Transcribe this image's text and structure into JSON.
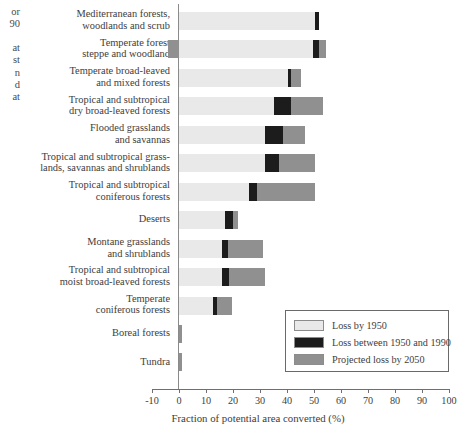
{
  "clipped_text": {
    "note": "text clipped at the left edge of the screenshot",
    "lines_top": [
      "or",
      "90"
    ],
    "lines_bottom": [
      "at",
      "st",
      "n",
      "d",
      "at"
    ]
  },
  "colors": {
    "loss_1950": "#e9e9e9",
    "loss_1950_1990": "#1c1c1c",
    "projected_2050": "#909090",
    "axis": "#6f6f6f",
    "text": "#3d3d3d"
  },
  "legend": {
    "items": [
      {
        "label": "Loss by 1950",
        "color_key": "loss_1950"
      },
      {
        "label": "Loss between 1950 and 1990",
        "color_key": "loss_1950_1990"
      },
      {
        "label": "Projected loss by 2050",
        "color_key": "projected_2050"
      }
    ]
  },
  "chart_data": {
    "type": "bar",
    "orientation": "horizontal",
    "stacked": true,
    "title": "",
    "xlabel": "Fraction of potential area converted (%)",
    "ylabel": "",
    "xlim": [
      -10,
      100
    ],
    "xticks": [
      -10,
      0,
      10,
      20,
      30,
      40,
      50,
      60,
      70,
      80,
      90,
      100
    ],
    "xtick_labels": [
      "-10",
      "0",
      "10",
      "20",
      "30",
      "40",
      "50",
      "60",
      "70",
      "80",
      "90",
      "100"
    ],
    "grid": false,
    "legend_position": "lower right",
    "categories": [
      "Mediterranean forests, woodlands and scrub",
      "Temperate forest steppe and woodland",
      "Temperate broad-leaved and mixed forests",
      "Tropical and subtropical dry broad-leaved forests",
      "Flooded grasslands and savannas",
      "Tropical and subtropical grasslands, savannas and shrublands",
      "Tropical and subtropical coniferous forests",
      "Deserts",
      "Montane grasslands and shrublands",
      "Tropical and subtropical moist broad-leaved forests",
      "Temperate coniferous forests",
      "Boreal forests",
      "Tundra"
    ],
    "category_label_lines": [
      [
        "Mediterranean forests,",
        "woodlands and scrub"
      ],
      [
        "Temperate forest",
        "steppe and woodland"
      ],
      [
        "Temperate broad-leaved",
        "and mixed forests"
      ],
      [
        "Tropical and subtropical",
        "dry broad-leaved forests"
      ],
      [
        "Flooded grasslands",
        "and savannas"
      ],
      [
        "Tropical and subtropical grass-",
        "lands, savannas and shrublands"
      ],
      [
        "Tropical and subtropical",
        "coniferous forests"
      ],
      [
        "Deserts"
      ],
      [
        "Montane grasslands",
        "and shrublands"
      ],
      [
        "Tropical and subtropical",
        "moist broad-leaved forests"
      ],
      [
        "Temperate",
        "coniferous forests"
      ],
      [
        "Boreal forests"
      ],
      [
        "Tundra"
      ]
    ],
    "series": [
      {
        "name": "Loss by 1950",
        "color": "#e9e9e9",
        "values": [
          50.5,
          49.5,
          40.5,
          35.0,
          32.0,
          32.0,
          26.0,
          17.0,
          16.0,
          16.0,
          12.5,
          0.0,
          0.0
        ]
      },
      {
        "name": "Loss between 1950 and 1990",
        "color": "#1c1c1c",
        "values": [
          1.5,
          2.5,
          0.8,
          6.5,
          6.5,
          5.0,
          3.0,
          3.0,
          2.0,
          2.5,
          1.5,
          0.0,
          0.0
        ]
      },
      {
        "name": "Projected loss by 2050",
        "color": "#909090",
        "values": [
          0.0,
          2.5,
          4.0,
          12.0,
          8.0,
          13.5,
          21.5,
          2.0,
          13.0,
          13.5,
          5.5,
          1.0,
          1.0
        ]
      }
    ],
    "totals": [
      52.0,
      54.5,
      45.3,
      53.5,
      46.5,
      50.5,
      50.5,
      22.0,
      31.0,
      32.0,
      19.5,
      1.0,
      1.0
    ],
    "negative_offsets": [
      0.0,
      -4.0,
      0.0,
      0.0,
      0.0,
      0.0,
      0.0,
      0.0,
      0.0,
      0.0,
      0.0,
      0.0,
      0.0
    ]
  }
}
